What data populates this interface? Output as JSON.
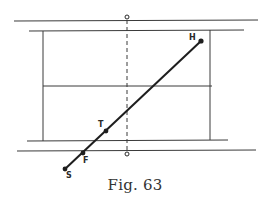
{
  "figure": {
    "caption": "Fig. 63",
    "colors": {
      "ink": "#2a2a2a",
      "light_ink": "#555555",
      "background": "#ffffff"
    },
    "points": {
      "H": {
        "label": "H",
        "x": 201,
        "y": 41
      },
      "T": {
        "label": "T",
        "x": 106,
        "y": 131
      },
      "F": {
        "label": "F",
        "x": 83,
        "y": 153
      },
      "S": {
        "label": "S",
        "x": 65,
        "y": 169
      },
      "O_top": {
        "label": "o",
        "x": 127,
        "y": 17
      },
      "O_bottom": {
        "label": "o",
        "x": 127,
        "y": 154
      }
    },
    "labels": {
      "H": "H",
      "T": "T",
      "F": "F",
      "S": "S"
    }
  }
}
